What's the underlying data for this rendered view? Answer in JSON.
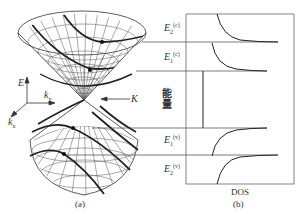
{
  "panel_a": {
    "caption": "(a)",
    "axes": {
      "energy": "E",
      "ky": "k",
      "ky_sub": "y",
      "kx": "k",
      "kx_sub": "x"
    },
    "dirac_point_label": "K",
    "description": "Graphene Dirac cones: upper conduction cone and lower valence cone touching at K point, with cut-lines marking quantized subbands"
  },
  "panel_b": {
    "caption": "(b)",
    "xlabel": "DOS",
    "ylabel": "能量",
    "levels": [
      {
        "id": "E2c",
        "symbol": "E",
        "sub": "2",
        "sup": "(c)",
        "band": "conduction"
      },
      {
        "id": "E1c",
        "symbol": "E",
        "sub": "1",
        "sup": "(c)",
        "band": "conduction"
      },
      {
        "id": "E1v",
        "symbol": "E",
        "sub": "1",
        "sup": "(v)",
        "band": "valence"
      },
      {
        "id": "E2v",
        "symbol": "E",
        "sub": "2",
        "sup": "(v)",
        "band": "valence"
      }
    ]
  },
  "colors": {
    "line": "#333333",
    "grid": "#555555",
    "frame": "#666666"
  }
}
